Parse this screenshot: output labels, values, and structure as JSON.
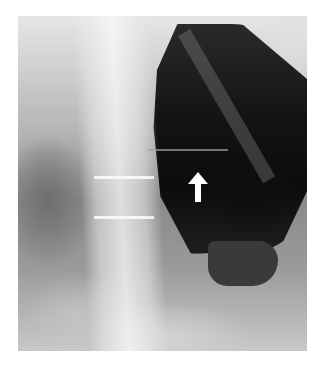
{
  "image": {
    "description": "Abdominal radiograph showing the lumbar spine and a large gas-filled dilated bowel/stomach with an air-fluid level",
    "annotation": {
      "type": "arrow",
      "direction": "up",
      "color": "#ffffff",
      "target": "air-fluid level"
    },
    "colors": {
      "background": "#ffffff",
      "gas": "#111111",
      "bone": "#f0f0f0",
      "soft_tissue": "#9a9a9a"
    }
  }
}
